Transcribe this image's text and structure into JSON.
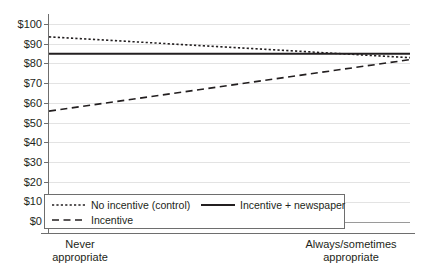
{
  "chart_data": {
    "type": "line",
    "title": "",
    "subtitle": "",
    "xlabel": "",
    "ylabel": "",
    "categories": [
      "Never\nappropriate",
      "Always/sometimes\nappropriate"
    ],
    "category_labels": [
      "Never appropriate",
      "Always/sometimes appropriate"
    ],
    "ylim": [
      0,
      100
    ],
    "ytick_step": 10,
    "ytick_labels": [
      "$100",
      "$90",
      "$80",
      "$70",
      "$60",
      "$50",
      "$40",
      "$30",
      "$20",
      "$10",
      "$0"
    ],
    "ytick_values": [
      100,
      90,
      80,
      70,
      60,
      50,
      40,
      30,
      20,
      10,
      0
    ],
    "grid": true,
    "grid_axis": "y",
    "legend_position": "inside lower-left",
    "series": [
      {
        "name": "No incentive (control)",
        "style": "dotted",
        "values": [
          93.5,
          83.0
        ]
      },
      {
        "name": "Incentive + newspaper",
        "style": "solid",
        "values": [
          85.0,
          85.0
        ]
      },
      {
        "name": "Incentive",
        "style": "dashed",
        "values": [
          56.0,
          82.0
        ]
      }
    ],
    "colors": {
      "line": "#231f20",
      "grid": "#e3e3e3",
      "axis": "#6e6e6e",
      "background": "#ffffff",
      "text": "#231f20"
    }
  },
  "legend": {
    "entries": [
      {
        "label": "No incentive (control)",
        "style": "dotted"
      },
      {
        "label": "Incentive + newspaper",
        "style": "solid"
      },
      {
        "label": "Incentive",
        "style": "dashed"
      }
    ]
  }
}
